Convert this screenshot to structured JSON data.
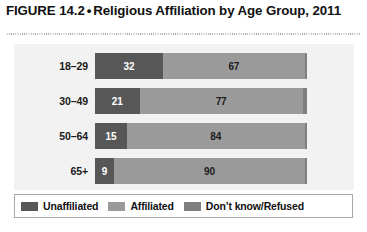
{
  "figure": {
    "label": "FIGURE 14.2",
    "bullet": "•",
    "title": "Religious Affiliation by Age Group, 2011"
  },
  "colors": {
    "unaffiliated": "#575757",
    "affiliated": "#9a9a9a",
    "dontknow": "#7f7f7f",
    "panel_background": "#f2f2f2",
    "legend_border": "#a8a8a8"
  },
  "legend": {
    "items": [
      {
        "label": "Unaffiliated",
        "color": "#575757",
        "swatch": "legend-swatch-unaffiliated"
      },
      {
        "label": "Affiliated",
        "color": "#9a9a9a",
        "swatch": "legend-swatch-affiliated"
      },
      {
        "label": "Don’t know/Refused",
        "color": "#7f7f7f",
        "swatch": "legend-swatch-dontknow"
      }
    ]
  },
  "chart_data": {
    "type": "bar",
    "orientation": "horizontal",
    "stacked": true,
    "percent_stacked": true,
    "xlabel": "",
    "ylabel": "Age Group",
    "xlim": [
      0,
      100
    ],
    "grid": false,
    "legend_position": "bottom",
    "categories": [
      "18–29",
      "30–49",
      "50–64",
      "65+"
    ],
    "series": [
      {
        "name": "Unaffiliated",
        "color": "#575757",
        "values": [
          32,
          21,
          15,
          9
        ]
      },
      {
        "name": "Affiliated",
        "color": "#9a9a9a",
        "values": [
          67,
          77,
          84,
          90
        ]
      },
      {
        "name": "Don’t know/Refused",
        "color": "#7f7f7f",
        "values": [
          1,
          2,
          1,
          1
        ]
      }
    ],
    "rows": [
      {
        "category": "18–29",
        "segments": [
          {
            "name": "Unaffiliated",
            "value": 32,
            "label": "32",
            "label_visible": true
          },
          {
            "name": "Affiliated",
            "value": 67,
            "label": "67",
            "label_visible": true
          },
          {
            "name": "Don’t know/Refused",
            "value": 1,
            "label": "",
            "label_visible": false
          }
        ]
      },
      {
        "category": "30–49",
        "segments": [
          {
            "name": "Unaffiliated",
            "value": 21,
            "label": "21",
            "label_visible": true
          },
          {
            "name": "Affiliated",
            "value": 77,
            "label": "77",
            "label_visible": true
          },
          {
            "name": "Don’t know/Refused",
            "value": 2,
            "label": "",
            "label_visible": false
          }
        ]
      },
      {
        "category": "50–64",
        "segments": [
          {
            "name": "Unaffiliated",
            "value": 15,
            "label": "15",
            "label_visible": true
          },
          {
            "name": "Affiliated",
            "value": 84,
            "label": "84",
            "label_visible": true
          },
          {
            "name": "Don’t know/Refused",
            "value": 1,
            "label": "",
            "label_visible": false
          }
        ]
      },
      {
        "category": "65+",
        "segments": [
          {
            "name": "Unaffiliated",
            "value": 9,
            "label": "9",
            "label_visible": true
          },
          {
            "name": "Affiliated",
            "value": 90,
            "label": "90",
            "label_visible": true
          },
          {
            "name": "Don’t know/Refused",
            "value": 1,
            "label": "",
            "label_visible": false
          }
        ]
      }
    ]
  }
}
